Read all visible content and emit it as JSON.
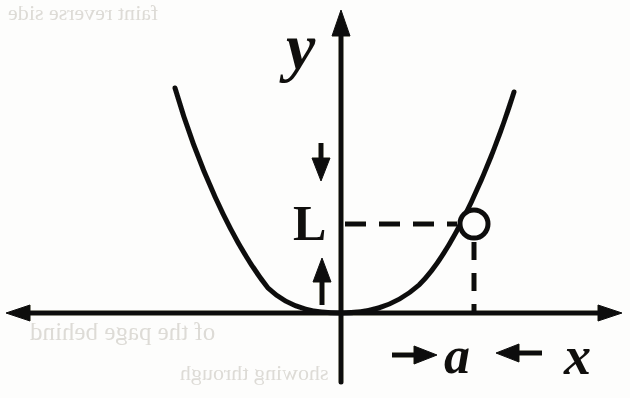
{
  "figure": {
    "kind": "coordinate-plane-diagram",
    "ink_color": "#100f0d",
    "paper_color": "#fdfdfc",
    "bleed_color": "#dddbd6",
    "width": 630,
    "height": 398
  },
  "axes": {
    "y_axis_label": "y",
    "x_axis_label": "x",
    "origin": {
      "x": 341,
      "y": 313
    },
    "y_axis_x": 341,
    "x_axis_y": 313,
    "y_axis_top": 10,
    "y_axis_bottom": 382,
    "x_axis_left": 6,
    "x_axis_right": 622
  },
  "curve": {
    "equation": "y = x^2",
    "vertex": {
      "x": 0,
      "y": 0
    },
    "opens": "up",
    "left_endpoint_px": {
      "x": 175,
      "y": 88
    },
    "right_endpoint_px": {
      "x": 514,
      "y": 92
    }
  },
  "point": {
    "marker": "open-circle",
    "center_px": {
      "x": 474,
      "y": 224
    },
    "radius_px": 14,
    "x_value_label": "a",
    "y_value_label": "L"
  },
  "annotations": {
    "vertical_measure_label": "L",
    "vertical_measure_meaning": "height of the point above the x-axis",
    "horizontal_measure_label": "a",
    "horizontal_measure_meaning": "horizontal distance of the point from the y-axis",
    "down_arrow_icon": "down-arrow-icon",
    "up_arrow_icon": "up-arrow-icon",
    "right_arrow_icon": "right-arrow-icon",
    "left_arrow_icon": "left-arrow-icon",
    "dashed_horizontal_guide": {
      "from_x": 345,
      "to_x": 461,
      "y": 224
    },
    "dashed_vertical_guide": {
      "x": 474,
      "from_y": 242,
      "to_y": 313
    }
  },
  "bleed_text": {
    "line_1": "of the page behind",
    "line_2": "showing through",
    "line_3": "faint reverse side"
  }
}
